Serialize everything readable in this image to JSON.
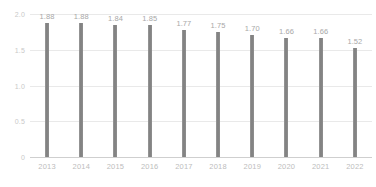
{
  "chart_data": {
    "type": "bar",
    "title": "",
    "subtitle": "",
    "xlabel": "",
    "ylabel": "",
    "categories": [
      "2013",
      "2014",
      "2015",
      "2016",
      "2017",
      "2018",
      "2019",
      "2020",
      "2021",
      "2022"
    ],
    "values": [
      1.88,
      1.88,
      1.84,
      1.85,
      1.77,
      1.75,
      1.7,
      1.66,
      1.66,
      1.52
    ],
    "data_labels": [
      "1.88",
      "1.88",
      "1.84",
      "1.85",
      "1.77",
      "1.75",
      "1.70",
      "1.66",
      "1.66",
      "1.52"
    ],
    "ylim": [
      0,
      2.0
    ],
    "y_ticks": [
      0,
      0.5,
      1.0,
      1.5,
      2.0
    ],
    "y_tick_labels": [
      "0",
      "0.5",
      "1.0",
      "1.5",
      "2.0"
    ],
    "grid": true,
    "legend": "none",
    "series": [
      {
        "name": "",
        "values": [
          1.88,
          1.88,
          1.84,
          1.85,
          1.77,
          1.75,
          1.7,
          1.66,
          1.66,
          1.52
        ]
      }
    ],
    "colors": {
      "bar": "#8a8a8a",
      "gridline": "#e9e9e9",
      "axis_line": "#cfcfcf",
      "tick_text": "#bdbdbd",
      "value_text": "#a8a8a8",
      "background": "#ffffff"
    }
  }
}
